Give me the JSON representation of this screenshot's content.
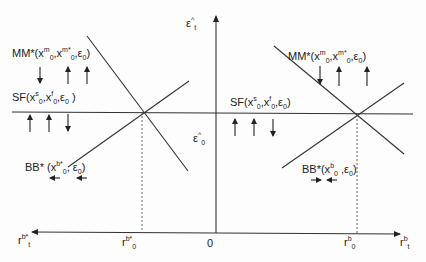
{
  "diagram": {
    "type": "two-panel equilibrium diagram",
    "axes": {
      "vertical_top_label": {
        "base": "ε",
        "sup": "^",
        "sub": "t"
      },
      "vertical_mid_label": {
        "base": "ε",
        "sup": "^",
        "sub": "0"
      },
      "origin_label": "0",
      "left_axis_label": {
        "base": "r",
        "sup": "b*",
        "sub": "t"
      },
      "right_axis_label": {
        "base": "r",
        "sup": "b",
        "sub": "t"
      },
      "left_tick_label": {
        "base": "r",
        "sup": "b*",
        "sub": "0"
      },
      "right_tick_label": {
        "base": "r",
        "sup": "b",
        "sub": "0"
      }
    },
    "left_panel": {
      "mm_label": {
        "prefix": "MM*(x",
        "s1": "m",
        "b1": "0",
        "mid": ",x",
        "s2": "m*",
        "b2": "0",
        "end": ",ε",
        "b3": "0",
        "close": ")"
      },
      "sf_label": {
        "prefix": "SF(x",
        "s1": "s",
        "b1": "0",
        "mid": ",x",
        "s2": "f",
        "b2": "0",
        "end": ",ε",
        "b3": "0",
        "close": " )"
      },
      "bb_label": {
        "prefix": "BB*  (x",
        "s1": "b*",
        "b1": "0",
        "end": ", ε",
        "b3": "0",
        "close": ")"
      },
      "mm_arrows": [
        "down",
        "up",
        "up"
      ],
      "sf_arrows": [
        "up",
        "up",
        "down"
      ],
      "bb_arrows": [
        "left",
        "left"
      ]
    },
    "right_panel": {
      "mm_label": {
        "prefix": "MM*(x",
        "s1": "m",
        "b1": "0",
        "mid": ",x",
        "s2": "m*",
        "b2": "0",
        "end": ",ε",
        "b3": "0",
        "close": ")"
      },
      "sf_label": {
        "prefix": "SF(x",
        "s1": "s",
        "b1": "0",
        "mid": ",x",
        "s2": "f",
        "b2": "0",
        "end": ",ε",
        "b3": "0",
        "close": ")"
      },
      "bb_label": {
        "prefix": "BB*(x",
        "s1": "b",
        "b1": "0",
        "end": " ,ε",
        "b3": "0",
        "close": ")"
      },
      "mm_arrows": [
        "down",
        "up",
        "up"
      ],
      "sf_arrows": [
        "up",
        "up",
        "down"
      ],
      "bb_arrows": [
        "right",
        "left"
      ]
    },
    "colors": {
      "line": "#222222",
      "dashed": "#555555",
      "background": "#fdfdfd"
    }
  }
}
